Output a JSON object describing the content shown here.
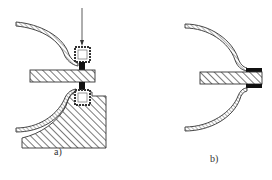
{
  "figure": {
    "type": "technical-diagram",
    "panels": [
      {
        "id": "a",
        "label": "a)",
        "elements": [
          "load-arrow",
          "upper-square-electrode",
          "hatched-plate",
          "upper-contact-block",
          "lower-contact-block",
          "lower-square-electrode",
          "hatched-base-fixture",
          "upper-curved-shell",
          "lower-curved-shell"
        ]
      },
      {
        "id": "b",
        "label": "b)",
        "elements": [
          "upper-curved-shell",
          "hatched-plate",
          "upper-joint-strip",
          "lower-joint-strip",
          "lower-curved-shell"
        ]
      }
    ],
    "colors": {
      "line": "#333333",
      "fill_black": "#111111",
      "background": "#ffffff"
    }
  }
}
